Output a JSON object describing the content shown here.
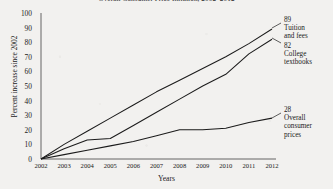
{
  "chart_data": {
    "type": "line",
    "title": "Overall Consumer Price Inflation, 2002–2012",
    "xlabel": "Years",
    "ylabel": "Percent increase since 2002",
    "grid": false,
    "legend_position": "right-inline-annotations",
    "xlim": [
      2002,
      2012
    ],
    "ylim": [
      0,
      100
    ],
    "ytick_labels": [
      "100",
      "90",
      "80",
      "70",
      "60",
      "50",
      "40",
      "30",
      "20",
      "10",
      "0"
    ],
    "ytick_values": [
      100,
      90,
      80,
      70,
      60,
      50,
      40,
      30,
      20,
      10,
      0
    ],
    "categories": [
      "2002",
      "2003",
      "2004",
      "2005",
      "2006",
      "2007",
      "2008",
      "2009",
      "2010",
      "2011",
      "2012"
    ],
    "x": [
      2002,
      2003,
      2004,
      2005,
      2006,
      2007,
      2008,
      2009,
      2010,
      2011,
      2012
    ],
    "series": [
      {
        "name": "Tuition and fees",
        "end_value": 89,
        "end_label": "89",
        "values": [
          0,
          10,
          19,
          28,
          37,
          46,
          54,
          62,
          70,
          79,
          89
        ]
      },
      {
        "name": "College textbooks",
        "end_value": 82,
        "end_label": "82",
        "values": [
          0,
          7,
          13,
          14,
          23,
          32,
          41,
          50,
          58,
          72,
          82
        ]
      },
      {
        "name": "Overall consumer prices",
        "end_value": 28,
        "end_label": "28",
        "values": [
          0,
          3,
          6,
          9,
          12,
          16,
          20,
          20,
          21,
          25,
          28
        ]
      }
    ],
    "annotations": [
      {
        "value": "89",
        "label_line1": "Tuition",
        "label_line2": "and fees",
        "label_line3": ""
      },
      {
        "value": "82",
        "label_line1": "College",
        "label_line2": "textbooks",
        "label_line3": ""
      },
      {
        "value": "28",
        "label_line1": "Overall",
        "label_line2": "consumer",
        "label_line3": "prices"
      }
    ],
    "colors": {
      "line": "#1b1b1b",
      "axis": "#555555",
      "text": "#1b1b1b",
      "background": "#f2f1ef"
    }
  }
}
